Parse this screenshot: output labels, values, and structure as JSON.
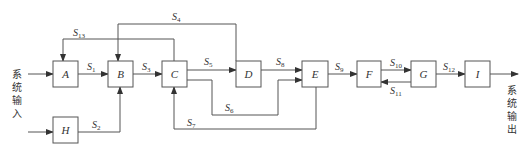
{
  "diagram": {
    "input_label": [
      "系",
      "统",
      "输",
      "入"
    ],
    "output_label": [
      "系",
      "统",
      "输",
      "出"
    ],
    "blocks": [
      {
        "id": "A",
        "label": "A"
      },
      {
        "id": "B",
        "label": "B"
      },
      {
        "id": "C",
        "label": "C"
      },
      {
        "id": "D",
        "label": "D"
      },
      {
        "id": "E",
        "label": "E"
      },
      {
        "id": "F",
        "label": "F"
      },
      {
        "id": "G",
        "label": "G"
      },
      {
        "id": "H",
        "label": "H"
      },
      {
        "id": "I",
        "label": "I"
      }
    ],
    "signals": [
      {
        "name": "S",
        "sub": "1",
        "from": "A",
        "to": "B"
      },
      {
        "name": "S",
        "sub": "2",
        "from": "H",
        "to": "B"
      },
      {
        "name": "S",
        "sub": "3",
        "from": "B",
        "to": "C"
      },
      {
        "name": "S",
        "sub": "4",
        "from": "D",
        "to": "B"
      },
      {
        "name": "S",
        "sub": "5",
        "from": "C",
        "to": "D"
      },
      {
        "name": "S",
        "sub": "6",
        "from": "C",
        "to": "E"
      },
      {
        "name": "S",
        "sub": "7",
        "from": "E",
        "to": "C"
      },
      {
        "name": "S",
        "sub": "8",
        "from": "D",
        "to": "E"
      },
      {
        "name": "S",
        "sub": "9",
        "from": "E",
        "to": "F"
      },
      {
        "name": "S",
        "sub": "10",
        "from": "F",
        "to": "G"
      },
      {
        "name": "S",
        "sub": "11",
        "from": "G",
        "to": "F"
      },
      {
        "name": "S",
        "sub": "12",
        "from": "G",
        "to": "I"
      },
      {
        "name": "S",
        "sub": "13",
        "from": "C",
        "to": "A"
      }
    ]
  }
}
